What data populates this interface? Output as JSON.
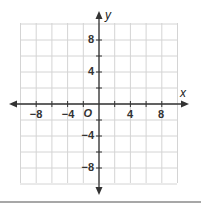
{
  "chart_data": {
    "type": "coordinate-plane",
    "title": "",
    "xlabel": "x",
    "ylabel": "y",
    "origin_label": "O",
    "xlim": [
      -10,
      10
    ],
    "ylim": [
      -10,
      10
    ],
    "grid": true,
    "grid_step": 2,
    "x_ticks": [
      -8,
      -4,
      4,
      8
    ],
    "y_ticks": [
      8,
      4,
      -4,
      -8
    ],
    "x_tick_labels": [
      "−8",
      "−4",
      "4",
      "8"
    ],
    "y_tick_labels": [
      "8",
      "4",
      "−4",
      "−8"
    ],
    "series": []
  },
  "colors": {
    "grid": "#d4d4d4",
    "axis": "#333333",
    "bottom_rule": "#8a8a8a"
  }
}
